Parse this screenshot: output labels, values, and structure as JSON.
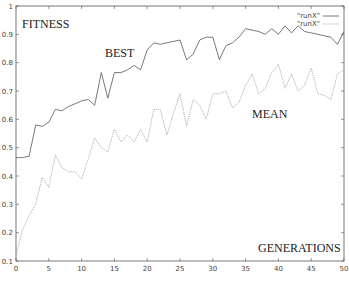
{
  "chart_data": {
    "type": "line",
    "title": "",
    "xlabel": "",
    "ylabel": "",
    "xlim": [
      0,
      50
    ],
    "ylim": [
      0.1,
      1
    ],
    "x_ticks": [
      0,
      5,
      10,
      15,
      20,
      25,
      30,
      35,
      40,
      45,
      50
    ],
    "y_ticks": [
      0.1,
      0.2,
      0.3,
      0.4,
      0.5,
      0.6,
      0.7,
      0.8,
      0.9,
      1
    ],
    "y_tick_labels": [
      "0.1",
      "0.2",
      "0.3",
      "0.4",
      "0.5",
      "0.6",
      "0.7",
      "0.8",
      "0.9",
      "1"
    ],
    "grid": false,
    "legend_position": "top-right",
    "annotations": [
      {
        "text": "FITNESS",
        "x": 1,
        "y": 0.93
      },
      {
        "text": "BEST",
        "x": 14,
        "y": 0.84
      },
      {
        "text": "MEAN",
        "x": 36,
        "y": 0.62
      },
      {
        "text": "GENERATIONS",
        "x": 38,
        "y": 0.15
      }
    ],
    "x": [
      0,
      1,
      2,
      3,
      4,
      5,
      6,
      7,
      8,
      9,
      10,
      11,
      12,
      13,
      14,
      15,
      16,
      17,
      18,
      19,
      20,
      21,
      22,
      23,
      24,
      25,
      26,
      27,
      28,
      29,
      30,
      31,
      32,
      33,
      34,
      35,
      36,
      37,
      38,
      39,
      40,
      41,
      42,
      43,
      44,
      45,
      46,
      47,
      48,
      49,
      50
    ],
    "series": [
      {
        "name": "\"runX\"",
        "label": "BEST",
        "style": "solid",
        "color": "#555555",
        "values": [
          0.465,
          0.465,
          0.47,
          0.58,
          0.575,
          0.59,
          0.635,
          0.63,
          0.645,
          0.655,
          0.665,
          0.67,
          0.65,
          0.765,
          0.675,
          0.765,
          0.765,
          0.775,
          0.79,
          0.775,
          0.845,
          0.87,
          0.865,
          0.87,
          0.875,
          0.88,
          0.81,
          0.83,
          0.88,
          0.89,
          0.89,
          0.81,
          0.86,
          0.87,
          0.89,
          0.92,
          0.915,
          0.91,
          0.9,
          0.92,
          0.9,
          0.93,
          0.905,
          0.93,
          0.91,
          0.905,
          0.9,
          0.895,
          0.89,
          0.865,
          0.91
        ]
      },
      {
        "name": "\"runX\"",
        "label": "MEAN",
        "style": "dotted",
        "color": "#9a9a9a",
        "values": [
          0.12,
          0.21,
          0.26,
          0.3,
          0.395,
          0.36,
          0.475,
          0.43,
          0.415,
          0.415,
          0.39,
          0.46,
          0.535,
          0.5,
          0.485,
          0.565,
          0.52,
          0.545,
          0.52,
          0.565,
          0.52,
          0.635,
          0.635,
          0.545,
          0.62,
          0.69,
          0.575,
          0.67,
          0.65,
          0.6,
          0.69,
          0.69,
          0.7,
          0.64,
          0.66,
          0.72,
          0.76,
          0.69,
          0.71,
          0.765,
          0.795,
          0.71,
          0.76,
          0.7,
          0.72,
          0.78,
          0.69,
          0.685,
          0.67,
          0.76,
          0.775
        ]
      }
    ]
  },
  "labels": {
    "fitness": "FITNESS",
    "best": "BEST",
    "mean": "MEAN",
    "generations": "GENERATIONS",
    "legend_1": "\"runX\"",
    "legend_2": "\"runX\""
  }
}
